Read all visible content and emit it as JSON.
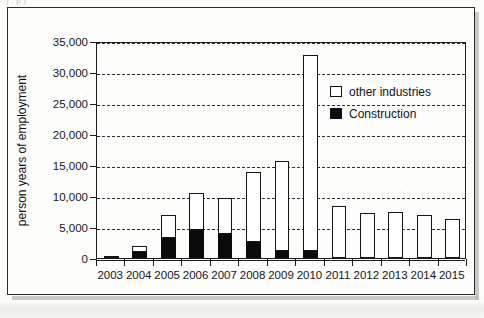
{
  "page": {
    "top_cut_text": ")   ,   p                                                      )"
  },
  "legend": {
    "position": "inside-top-right",
    "items": [
      {
        "label": "other industries",
        "swatch": "hollow-square-icon",
        "color": "#ffffff"
      },
      {
        "label": "Construction",
        "swatch": "filled-square-icon",
        "color": "#0b0b0b"
      }
    ]
  },
  "chart_data": {
    "type": "bar",
    "stacked": true,
    "title": "",
    "xlabel": "",
    "ylabel": "person years of employment",
    "ylim": [
      0,
      35000
    ],
    "ytick_step": 5000,
    "ytick_labels": [
      "0",
      "5,000",
      "10,000",
      "15,000",
      "20,000",
      "25,000",
      "30,000",
      "35,000"
    ],
    "ytick_values": [
      0,
      5000,
      10000,
      15000,
      20000,
      25000,
      30000,
      35000
    ],
    "grid": true,
    "grid_style": "dashed-horizontal",
    "legend_position": "upper right inside",
    "categories": [
      "2003",
      "2004",
      "2005",
      "2006",
      "2007",
      "2008",
      "2009",
      "2010",
      "2011",
      "2012",
      "2013",
      "2014",
      "2015"
    ],
    "series": [
      {
        "name": "Construction",
        "color": "#0b0b0b",
        "values": [
          0,
          900,
          3300,
          4500,
          3800,
          2600,
          1200,
          1200,
          0,
          0,
          0,
          0,
          0
        ]
      },
      {
        "name": "other industries",
        "color": "#ffffff",
        "values": [
          300,
          1050,
          3650,
          6050,
          5950,
          11250,
          14500,
          31600,
          8350,
          7300,
          7450,
          6900,
          6300
        ]
      }
    ],
    "totals": [
      300,
      1950,
      6950,
      10550,
      9750,
      13850,
      15700,
      32800,
      8350,
      7300,
      7450,
      6900,
      6300
    ]
  }
}
